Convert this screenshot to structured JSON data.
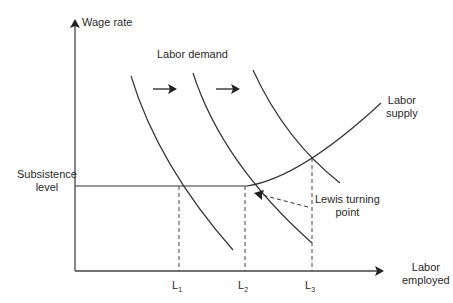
{
  "diagram": {
    "axes": {
      "y_label": "Wage rate",
      "x_label_line1": "Labor",
      "x_label_line2": "employed"
    },
    "labels": {
      "labor_demand": "Labor demand",
      "labor_supply_line1": "Labor",
      "labor_supply_line2": "supply",
      "subsistence_line1": "Subsistence",
      "subsistence_line2": "level",
      "lewis_line1": "Lewis turning",
      "lewis_line2": "point"
    },
    "x_ticks": [
      {
        "letter": "L",
        "sub": "1"
      },
      {
        "letter": "L",
        "sub": "2"
      },
      {
        "letter": "L",
        "sub": "3"
      }
    ],
    "curves": {
      "demand": [
        "Labor demand 1",
        "Labor demand 2",
        "Labor demand 3"
      ],
      "supply": "Labor supply (flat at subsistence level until L2, then rising)"
    },
    "colors": {
      "line": "#333333",
      "background": "#ffffff"
    }
  }
}
